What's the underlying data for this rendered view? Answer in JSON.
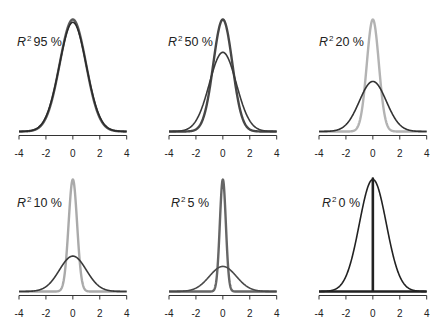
{
  "chart_data": {
    "type": "line",
    "title": "",
    "xlabel": "",
    "ylabel": "",
    "xlim": [
      -4,
      4
    ],
    "x_ticks": [
      -4,
      -2,
      0,
      2,
      4
    ],
    "x_tick_labels": [
      "-4",
      "-2",
      "0",
      "2",
      "4"
    ],
    "grid": false,
    "layout": {
      "rows": 2,
      "cols": 3
    },
    "panels": [
      {
        "label_r": "R",
        "label_sup": "2",
        "label_value": "95 %",
        "r2": 0.95,
        "series": [
          {
            "name": "total",
            "sd": 1.0,
            "color": "#2a2a2a"
          },
          {
            "name": "predicted",
            "sd": 0.975,
            "color": "#5a5a5a"
          }
        ]
      },
      {
        "label_r": "R",
        "label_sup": "2",
        "label_value": "50 %",
        "r2": 0.5,
        "series": [
          {
            "name": "total",
            "sd": 1.0,
            "color": "#3a3a3a"
          },
          {
            "name": "predicted",
            "sd": 0.707,
            "color": "#474747"
          }
        ]
      },
      {
        "label_r": "R",
        "label_sup": "2",
        "label_value": "20 %",
        "r2": 0.2,
        "series": [
          {
            "name": "total",
            "sd": 1.0,
            "color": "#333333"
          },
          {
            "name": "predicted",
            "sd": 0.447,
            "color": "#b3b3b3"
          }
        ]
      },
      {
        "label_r": "R",
        "label_sup": "2",
        "label_value": "10 %",
        "r2": 0.1,
        "series": [
          {
            "name": "total",
            "sd": 1.0,
            "color": "#3a3a3a"
          },
          {
            "name": "predicted",
            "sd": 0.316,
            "color": "#aaaaaa"
          }
        ]
      },
      {
        "label_r": "R",
        "label_sup": "2",
        "label_value": "5 %",
        "r2": 0.05,
        "series": [
          {
            "name": "total",
            "sd": 1.0,
            "color": "#4a4a4a"
          },
          {
            "name": "predicted",
            "sd": 0.224,
            "color": "#666666"
          }
        ]
      },
      {
        "label_r": "R",
        "label_sup": "2",
        "label_value": "0 %",
        "r2": 0.0,
        "series": [
          {
            "name": "total",
            "sd": 1.0,
            "color": "#222222"
          },
          {
            "name": "predicted",
            "sd": 0.0,
            "color": "#222222"
          }
        ]
      }
    ]
  }
}
